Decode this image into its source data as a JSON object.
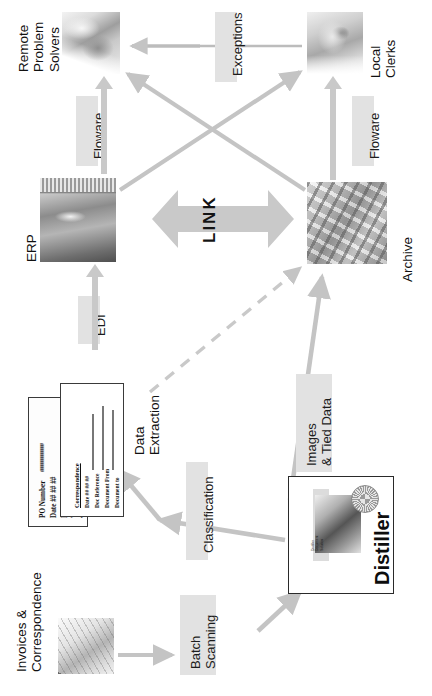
{
  "diagram": {
    "orientation": "rotated-90-ccw",
    "accent_grey": "#c9c9c9",
    "plaque_grey": "#e2e2e2"
  },
  "nodes": {
    "remote_problem_solvers": {
      "label": "Remote\nProblem\nSolvers",
      "icon": "hands-with-paper-photo"
    },
    "local_clerks": {
      "label": "Local\nClerks",
      "icon": "clerk-portrait-photo"
    },
    "erp": {
      "label": "ERP",
      "icon": "server-rack-photo"
    },
    "archive": {
      "label": "Archive",
      "icon": "filing-shelves-photo"
    },
    "invoices_correspondence": {
      "label": "Invoices &\nCorrespondence",
      "icon": "paper-documents-photo"
    },
    "distiller": {
      "label": "Distiller",
      "icon": "distiller-product-box"
    }
  },
  "connectors": {
    "link": "LINK",
    "exceptions": "Exceptions",
    "floware_left": "Floware",
    "floware_right": "Floware",
    "edi": "EDI",
    "data_extraction": "Data\nExtraction",
    "classification": "Classification",
    "batch_scanning": "Batch\nScanning",
    "images_tied_data": "Images\n& Tied Data"
  },
  "documents": {
    "invoice": {
      "fields": [
        "PO Number",
        "Date ## ## ##",
        "Invoi",
        "VAT",
        "Total"
      ],
      "hash_values": [
        "##############",
        "## ## ##",
        "",
        "",
        ""
      ]
    },
    "correspondence": {
      "heading": "Correspondence",
      "fields": [
        "Date ## ## ##",
        "Doc Reference",
        "Document From",
        "Document to"
      ]
    }
  },
  "distiller_card": {
    "word": "Distiller",
    "subtitle": "Distiller\nDocument\nSolution"
  }
}
